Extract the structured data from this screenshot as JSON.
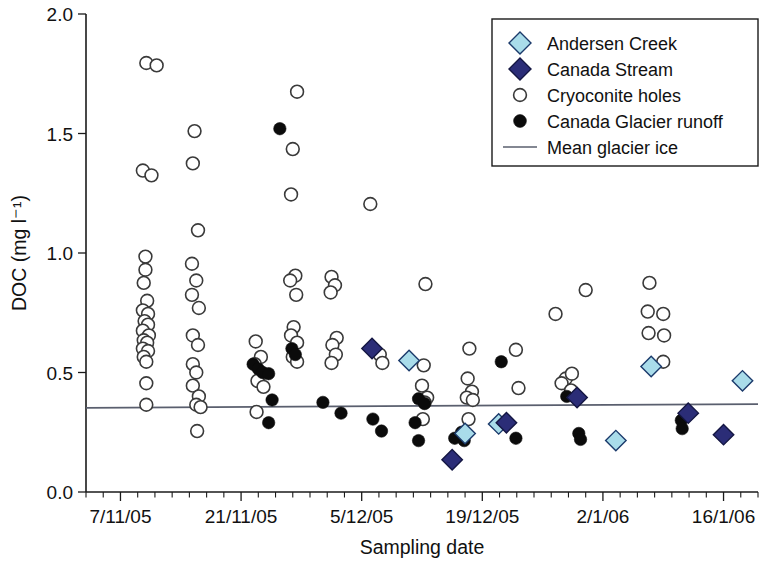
{
  "chart_data": {
    "type": "scatter",
    "title": "",
    "xlabel": "Sampling date",
    "ylabel": "DOC (mg l⁻¹)",
    "ylim": [
      0.0,
      2.0
    ],
    "yticks": [
      "0.0",
      "0.5",
      "1.0",
      "1.5",
      "2.0"
    ],
    "ytick_values": [
      0.0,
      0.5,
      1.0,
      1.5,
      2.0
    ],
    "xlim_days": [
      0,
      78
    ],
    "xticks": [
      "7/11/05",
      "21/11/05",
      "5/12/05",
      "19/12/05",
      "2/1/06",
      "16/1/06"
    ],
    "xtick_days": [
      4,
      18,
      32,
      46,
      60,
      74
    ],
    "minor_tick_interval_days": 2,
    "grid": false,
    "legend_position": "top-right",
    "annotations": [],
    "reference_lines": [
      {
        "name": "Mean glacier ice",
        "y_start": 0.352,
        "y_end": 0.368,
        "color": "#5a5f6e"
      }
    ],
    "series": [
      {
        "name": "Andersen Creek",
        "marker": "diamond",
        "color": "#a9dcea",
        "edge_color": "#1b3a6b",
        "points": [
          {
            "x": 37.5,
            "y": 0.55
          },
          {
            "x": 44.0,
            "y": 0.245
          },
          {
            "x": 47.9,
            "y": 0.285
          },
          {
            "x": 61.5,
            "y": 0.215
          },
          {
            "x": 65.6,
            "y": 0.525
          },
          {
            "x": 76.2,
            "y": 0.465
          }
        ]
      },
      {
        "name": "Canada Stream",
        "marker": "diamond",
        "color": "#2b2d77",
        "edge_color": "#141642",
        "points": [
          {
            "x": 33.2,
            "y": 0.6
          },
          {
            "x": 42.5,
            "y": 0.135
          },
          {
            "x": 48.8,
            "y": 0.29
          },
          {
            "x": 57.0,
            "y": 0.395
          },
          {
            "x": 69.9,
            "y": 0.33
          },
          {
            "x": 74.0,
            "y": 0.24
          }
        ]
      },
      {
        "name": "Cryoconite holes",
        "marker": "circle-open",
        "color": "#ffffff",
        "edge_color": "#3a3a3a",
        "points": [
          {
            "x": 7.0,
            "y": 1.795
          },
          {
            "x": 8.2,
            "y": 1.785
          },
          {
            "x": 6.6,
            "y": 1.345
          },
          {
            "x": 7.6,
            "y": 1.325
          },
          {
            "x": 6.9,
            "y": 0.985
          },
          {
            "x": 6.9,
            "y": 0.93
          },
          {
            "x": 6.7,
            "y": 0.875
          },
          {
            "x": 7.1,
            "y": 0.8
          },
          {
            "x": 6.6,
            "y": 0.76
          },
          {
            "x": 7.2,
            "y": 0.745
          },
          {
            "x": 6.8,
            "y": 0.715
          },
          {
            "x": 7.2,
            "y": 0.7
          },
          {
            "x": 6.6,
            "y": 0.675
          },
          {
            "x": 7.3,
            "y": 0.655
          },
          {
            "x": 6.7,
            "y": 0.635
          },
          {
            "x": 7.1,
            "y": 0.625
          },
          {
            "x": 6.6,
            "y": 0.6
          },
          {
            "x": 7.2,
            "y": 0.59
          },
          {
            "x": 6.7,
            "y": 0.565
          },
          {
            "x": 7.0,
            "y": 0.545
          },
          {
            "x": 7.0,
            "y": 0.455
          },
          {
            "x": 7.0,
            "y": 0.365
          },
          {
            "x": 12.6,
            "y": 1.51
          },
          {
            "x": 12.4,
            "y": 1.375
          },
          {
            "x": 13.0,
            "y": 1.095
          },
          {
            "x": 12.3,
            "y": 0.955
          },
          {
            "x": 12.8,
            "y": 0.885
          },
          {
            "x": 12.3,
            "y": 0.825
          },
          {
            "x": 13.1,
            "y": 0.77
          },
          {
            "x": 12.4,
            "y": 0.655
          },
          {
            "x": 13.0,
            "y": 0.615
          },
          {
            "x": 12.4,
            "y": 0.535
          },
          {
            "x": 12.8,
            "y": 0.5
          },
          {
            "x": 12.4,
            "y": 0.445
          },
          {
            "x": 13.1,
            "y": 0.4
          },
          {
            "x": 12.8,
            "y": 0.365
          },
          {
            "x": 13.3,
            "y": 0.355
          },
          {
            "x": 12.9,
            "y": 0.255
          },
          {
            "x": 19.7,
            "y": 0.63
          },
          {
            "x": 20.3,
            "y": 0.565
          },
          {
            "x": 19.6,
            "y": 0.535
          },
          {
            "x": 20.4,
            "y": 0.495
          },
          {
            "x": 19.9,
            "y": 0.465
          },
          {
            "x": 20.6,
            "y": 0.44
          },
          {
            "x": 19.8,
            "y": 0.335
          },
          {
            "x": 24.5,
            "y": 1.675
          },
          {
            "x": 24.0,
            "y": 1.435
          },
          {
            "x": 23.8,
            "y": 1.245
          },
          {
            "x": 24.3,
            "y": 0.905
          },
          {
            "x": 23.7,
            "y": 0.885
          },
          {
            "x": 24.4,
            "y": 0.825
          },
          {
            "x": 24.1,
            "y": 0.69
          },
          {
            "x": 23.8,
            "y": 0.655
          },
          {
            "x": 24.5,
            "y": 0.625
          },
          {
            "x": 24.0,
            "y": 0.565
          },
          {
            "x": 24.5,
            "y": 0.545
          },
          {
            "x": 28.5,
            "y": 0.9
          },
          {
            "x": 28.9,
            "y": 0.865
          },
          {
            "x": 28.4,
            "y": 0.835
          },
          {
            "x": 29.1,
            "y": 0.645
          },
          {
            "x": 28.6,
            "y": 0.615
          },
          {
            "x": 29.0,
            "y": 0.575
          },
          {
            "x": 28.5,
            "y": 0.54
          },
          {
            "x": 33.0,
            "y": 1.205
          },
          {
            "x": 34.1,
            "y": 0.575
          },
          {
            "x": 34.4,
            "y": 0.54
          },
          {
            "x": 39.4,
            "y": 0.87
          },
          {
            "x": 39.2,
            "y": 0.53
          },
          {
            "x": 39.0,
            "y": 0.445
          },
          {
            "x": 39.6,
            "y": 0.395
          },
          {
            "x": 39.3,
            "y": 0.375
          },
          {
            "x": 39.1,
            "y": 0.305
          },
          {
            "x": 44.5,
            "y": 0.6
          },
          {
            "x": 44.3,
            "y": 0.475
          },
          {
            "x": 44.8,
            "y": 0.42
          },
          {
            "x": 44.2,
            "y": 0.395
          },
          {
            "x": 44.9,
            "y": 0.385
          },
          {
            "x": 44.4,
            "y": 0.305
          },
          {
            "x": 49.9,
            "y": 0.595
          },
          {
            "x": 50.2,
            "y": 0.435
          },
          {
            "x": 54.5,
            "y": 0.745
          },
          {
            "x": 55.7,
            "y": 0.475
          },
          {
            "x": 56.4,
            "y": 0.495
          },
          {
            "x": 55.2,
            "y": 0.455
          },
          {
            "x": 56.3,
            "y": 0.425
          },
          {
            "x": 58.0,
            "y": 0.845
          },
          {
            "x": 65.4,
            "y": 0.875
          },
          {
            "x": 65.2,
            "y": 0.755
          },
          {
            "x": 67.0,
            "y": 0.745
          },
          {
            "x": 65.3,
            "y": 0.665
          },
          {
            "x": 67.1,
            "y": 0.655
          },
          {
            "x": 67.0,
            "y": 0.545
          }
        ]
      },
      {
        "name": "Canada Glacier runoff",
        "marker": "circle-filled",
        "color": "#0b0b0b",
        "edge_color": "#0b0b0b",
        "points": [
          {
            "x": 22.5,
            "y": 1.52
          },
          {
            "x": 19.4,
            "y": 0.535
          },
          {
            "x": 20.0,
            "y": 0.515
          },
          {
            "x": 20.5,
            "y": 0.5
          },
          {
            "x": 21.2,
            "y": 0.495
          },
          {
            "x": 23.9,
            "y": 0.6
          },
          {
            "x": 24.3,
            "y": 0.575
          },
          {
            "x": 21.6,
            "y": 0.385
          },
          {
            "x": 21.2,
            "y": 0.29
          },
          {
            "x": 27.5,
            "y": 0.375
          },
          {
            "x": 29.6,
            "y": 0.33
          },
          {
            "x": 33.3,
            "y": 0.305
          },
          {
            "x": 34.3,
            "y": 0.255
          },
          {
            "x": 38.6,
            "y": 0.39
          },
          {
            "x": 39.3,
            "y": 0.37
          },
          {
            "x": 38.2,
            "y": 0.29
          },
          {
            "x": 38.6,
            "y": 0.215
          },
          {
            "x": 42.8,
            "y": 0.225
          },
          {
            "x": 43.6,
            "y": 0.25
          },
          {
            "x": 43.9,
            "y": 0.215
          },
          {
            "x": 48.2,
            "y": 0.545
          },
          {
            "x": 49.9,
            "y": 0.225
          },
          {
            "x": 55.8,
            "y": 0.4
          },
          {
            "x": 57.2,
            "y": 0.245
          },
          {
            "x": 57.4,
            "y": 0.22
          },
          {
            "x": 69.1,
            "y": 0.3
          },
          {
            "x": 69.2,
            "y": 0.265
          }
        ]
      }
    ]
  },
  "legend": {
    "items": [
      {
        "label": "Andersen Creek",
        "marker": "diamond",
        "color": "#a9dcea"
      },
      {
        "label": "Canada Stream",
        "marker": "diamond",
        "color": "#2b2d77"
      },
      {
        "label": "Cryoconite holes",
        "marker": "circle-open",
        "color": "#ffffff"
      },
      {
        "label": "Canada Glacier runoff",
        "marker": "circle-filled",
        "color": "#0b0b0b"
      },
      {
        "label": "Mean glacier ice",
        "marker": "line",
        "color": "#5a5f6e"
      }
    ]
  }
}
